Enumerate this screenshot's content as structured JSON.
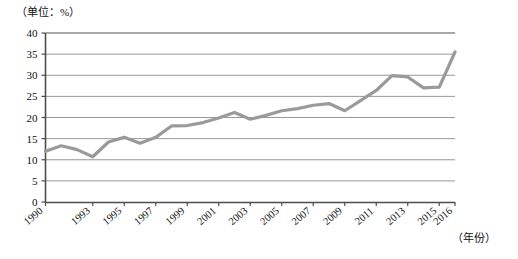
{
  "chart_data": {
    "type": "line",
    "title": "",
    "unit_note": "（单位：%）",
    "xlabel": "（年份）",
    "ylabel": "",
    "ylim": [
      0,
      40
    ],
    "ytick_step": 5,
    "yticks": [
      "0",
      "5",
      "10",
      "15",
      "20",
      "25",
      "30",
      "35",
      "40"
    ],
    "grid": true,
    "legend": "none",
    "x": [
      1990,
      1991,
      1992,
      1993,
      1994,
      1995,
      1996,
      1997,
      1998,
      1999,
      2000,
      2001,
      2002,
      2003,
      2004,
      2005,
      2006,
      2007,
      2008,
      2009,
      2010,
      2011,
      2012,
      2013,
      2014,
      2015,
      2016
    ],
    "xtick_labels": [
      "1990",
      "1993",
      "1995",
      "1997",
      "1999",
      "2001",
      "2003",
      "2005",
      "2007",
      "2009",
      "2011",
      "2013",
      "2015",
      "2016"
    ],
    "xtick_values": [
      1990,
      1993,
      1995,
      1997,
      1999,
      2001,
      2003,
      2005,
      2007,
      2009,
      2011,
      2013,
      2015,
      2016
    ],
    "values": [
      12.0,
      13.3,
      12.4,
      10.7,
      14.2,
      15.3,
      13.9,
      15.3,
      18.0,
      18.1,
      18.8,
      19.9,
      21.2,
      19.6,
      20.5,
      21.6,
      22.1,
      22.9,
      23.3,
      21.6,
      24.0,
      26.4,
      29.9,
      29.6,
      27.0,
      27.2,
      35.5
    ],
    "series_color": "#9a9a9a",
    "axis_color": "#4d4d4d",
    "grid_color": "#8c8c8c"
  }
}
